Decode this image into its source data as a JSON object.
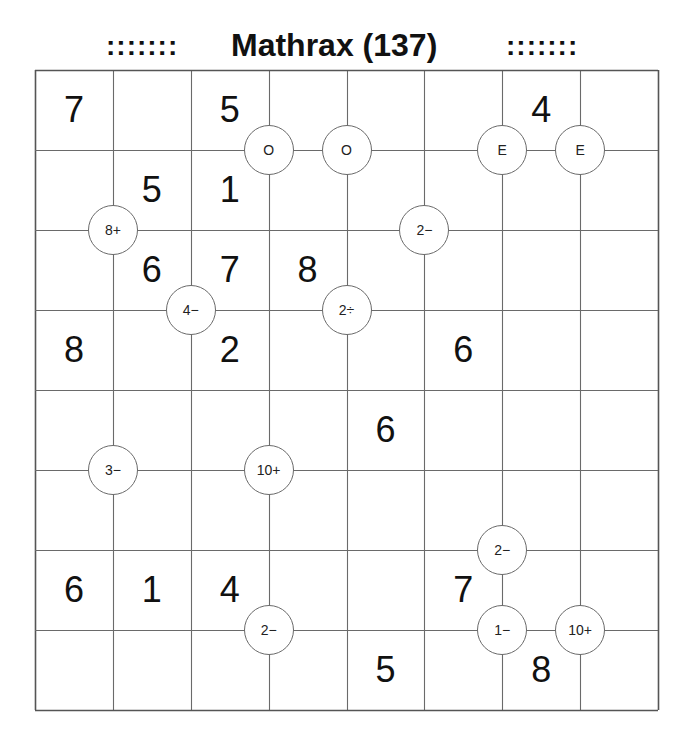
{
  "header": {
    "left_ornament": ":::::::",
    "title": "Mathrax (137)",
    "right_ornament": ":::::::"
  },
  "board": {
    "rows": 8,
    "cols": 8,
    "line_color": "#6a6a6a",
    "border_color": "#555555",
    "given_digits": [
      [
        "7",
        "",
        "5",
        "",
        "",
        "",
        "4",
        ""
      ],
      [
        "",
        "5",
        "1",
        "",
        "",
        "",
        "",
        ""
      ],
      [
        "",
        "6",
        "7",
        "8",
        "",
        "",
        "",
        ""
      ],
      [
        "8",
        "",
        "2",
        "",
        "",
        "6",
        "",
        ""
      ],
      [
        "",
        "",
        "",
        "",
        "6",
        "",
        "",
        ""
      ],
      [
        "",
        "",
        "",
        "",
        "",
        "",
        "",
        ""
      ],
      [
        "6",
        "1",
        "4",
        "",
        "",
        "7",
        "",
        ""
      ],
      [
        "",
        "",
        "",
        "",
        "5",
        "",
        "8",
        ""
      ]
    ],
    "clues": [
      {
        "label": "O",
        "type": "odd",
        "col_line": 3,
        "row_line": 1
      },
      {
        "label": "O",
        "type": "odd",
        "col_line": 4,
        "row_line": 1
      },
      {
        "label": "E",
        "type": "even",
        "col_line": 6,
        "row_line": 1
      },
      {
        "label": "E",
        "type": "even",
        "col_line": 7,
        "row_line": 1
      },
      {
        "label": "8+",
        "type": "sum",
        "col_line": 1,
        "row_line": 2
      },
      {
        "label": "2−",
        "type": "difference",
        "col_line": 5,
        "row_line": 2
      },
      {
        "label": "4−",
        "type": "difference",
        "col_line": 2,
        "row_line": 3
      },
      {
        "label": "2÷",
        "type": "quotient",
        "col_line": 4,
        "row_line": 3
      },
      {
        "label": "3−",
        "type": "difference",
        "col_line": 1,
        "row_line": 5
      },
      {
        "label": "10+",
        "type": "sum",
        "col_line": 3,
        "row_line": 5
      },
      {
        "label": "2−",
        "type": "difference",
        "col_line": 6,
        "row_line": 6
      },
      {
        "label": "2−",
        "type": "difference",
        "col_line": 3,
        "row_line": 7
      },
      {
        "label": "1−",
        "type": "difference",
        "col_line": 6,
        "row_line": 7
      },
      {
        "label": "10+",
        "type": "sum",
        "col_line": 7,
        "row_line": 7
      }
    ]
  }
}
